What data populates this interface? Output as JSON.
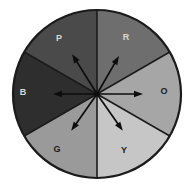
{
  "figure": {
    "background_color": "#ffffff",
    "outline_color": "#1b1b1b",
    "center": {
      "x": 97,
      "y": 94
    },
    "radius": 84
  },
  "chart_data": {
    "type": "pie",
    "title": "",
    "xlabel": "",
    "ylabel": "",
    "categories": [
      "P",
      "R",
      "O",
      "Y",
      "G",
      "B"
    ],
    "values": [
      60,
      60,
      60,
      60,
      60,
      60
    ],
    "units": "degrees",
    "legend_position": "none",
    "grid": false,
    "slices": [
      {
        "label": "P",
        "name": "purple",
        "start_angle": 90,
        "end_angle": 150,
        "sweep": 60,
        "color": "#4a4a4a",
        "label_x": 59,
        "label_y": 39,
        "label_tone": "dark"
      },
      {
        "label": "R",
        "name": "red",
        "start_angle": 30,
        "end_angle": 90,
        "sweep": 60,
        "color": "#6e6e6e",
        "label_x": 126,
        "label_y": 38,
        "label_tone": "dark"
      },
      {
        "label": "O",
        "name": "orange",
        "start_angle": -30,
        "end_angle": 30,
        "sweep": 60,
        "color": "#a6a6a6",
        "label_x": 164,
        "label_y": 92,
        "label_tone": "light"
      },
      {
        "label": "Y",
        "name": "yellow",
        "start_angle": -90,
        "end_angle": -30,
        "sweep": 60,
        "color": "#c6c6c6",
        "label_x": 124,
        "label_y": 151,
        "label_tone": "light"
      },
      {
        "label": "G",
        "name": "green",
        "start_angle": -150,
        "end_angle": -90,
        "sweep": 60,
        "color": "#9a9a9a",
        "label_x": 57,
        "label_y": 150,
        "label_tone": "light"
      },
      {
        "label": "B",
        "name": "blue",
        "start_angle": 150,
        "end_angle": 210,
        "sweep": 60,
        "color": "#2e2e2e",
        "label_x": 23,
        "label_y": 93,
        "label_tone": "dark"
      }
    ],
    "arrows": [
      {
        "name": "arrow-to-red",
        "angle": 60,
        "length": 44,
        "target_sector": "R"
      },
      {
        "name": "arrow-to-orange",
        "angle": 0,
        "length": 46,
        "target_sector": "O"
      },
      {
        "name": "arrow-to-yellow",
        "angle": -55,
        "length": 45,
        "target_sector": "Y"
      },
      {
        "name": "arrow-to-green",
        "angle": -125,
        "length": 45,
        "target_sector": "G"
      },
      {
        "name": "arrow-to-blue",
        "angle": 180,
        "length": 44,
        "target_sector": "B"
      },
      {
        "name": "arrow-to-purple",
        "angle": 122,
        "length": 47,
        "target_sector": "P"
      }
    ],
    "dividers": [
      {
        "angle": 90
      },
      {
        "angle": 30
      },
      {
        "angle": -30
      },
      {
        "angle": -90
      },
      {
        "angle": -150
      },
      {
        "angle": 150
      }
    ]
  }
}
